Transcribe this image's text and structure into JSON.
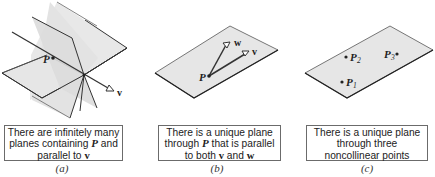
{
  "panels": [
    {
      "id": "a",
      "label": "(a)",
      "figure_labels": {
        "point": "P",
        "vector": "v"
      },
      "caption": {
        "line1": "There are infinitely many",
        "line2_pre": "planes containing ",
        "line2_math": "P",
        "line2_post": " and",
        "line3_pre": "parallel to ",
        "line3_vec": "v"
      }
    },
    {
      "id": "b",
      "label": "(b)",
      "figure_labels": {
        "point": "P",
        "vector_v": "v",
        "vector_w": "w"
      },
      "caption": {
        "line1": "There is a unique plane",
        "line2_pre": "through ",
        "line2_math": "P",
        "line2_post": " that is parallel",
        "line3_pre": "to both ",
        "line3_vec1": "v",
        "line3_mid": " and ",
        "line3_vec2": "w"
      }
    },
    {
      "id": "c",
      "label": "(c)",
      "figure_labels": {
        "p1": "P",
        "p1_sub": "1",
        "p2": "P",
        "p2_sub": "2",
        "p3": "P",
        "p3_sub": "3"
      },
      "caption": {
        "line1": "There is a unique plane",
        "line2": "through three",
        "line3": "noncollinear points"
      }
    }
  ],
  "colors": {
    "plane_fill": "#e6e6e6",
    "plane_stroke": "#333333",
    "line": "#333333",
    "caption_border": "#6b6b6b"
  }
}
